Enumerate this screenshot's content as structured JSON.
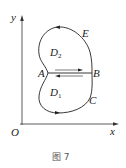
{
  "figure": {
    "caption": "图 7",
    "axes": {
      "x_label": "x",
      "y_label": "y",
      "origin_label": "O"
    },
    "points": {
      "A": "A",
      "B": "B",
      "C": "C",
      "E": "E"
    },
    "regions": {
      "D1": {
        "main": "D",
        "sub": "1"
      },
      "D2": {
        "main": "D",
        "sub": "2"
      }
    },
    "colors": {
      "stroke": "#222222",
      "caption": "#555555",
      "background": "#ffffff"
    }
  }
}
